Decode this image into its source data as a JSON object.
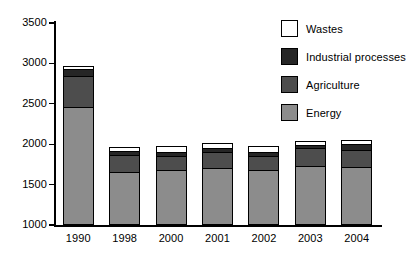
{
  "chart_data": {
    "type": "bar",
    "subtype": "stacked-bar",
    "title": "",
    "subtitle": "",
    "xlabel": "",
    "ylabel": "",
    "categories": [
      "1990",
      "1998",
      "2000",
      "2001",
      "2002",
      "2003",
      "2004"
    ],
    "ylim": [
      1000,
      3500
    ],
    "yticks": [
      1000,
      1500,
      2000,
      2500,
      3000,
      3500
    ],
    "ytick_labels": [
      "1000",
      "1500",
      "2000",
      "2500",
      "3000",
      "3500"
    ],
    "y_axis_starts_at_zero": false,
    "grid": false,
    "legend_position": "top-right",
    "stack_order_bottom_to_top": [
      "Energy",
      "Agriculture",
      "Industrial processes",
      "Wastes"
    ],
    "series": [
      {
        "name": "Energy",
        "color": "#8c8c8c",
        "values": [
          1465,
          650,
          680,
          705,
          675,
          725,
          720
        ]
      },
      {
        "name": "Agriculture",
        "color": "#4d4d4d",
        "values": [
          375,
          220,
          175,
          195,
          185,
          230,
          210
        ]
      },
      {
        "name": "Industrial processes",
        "color": "#262626",
        "values": [
          90,
          45,
          55,
          50,
          45,
          35,
          70
        ]
      },
      {
        "name": "Wastes",
        "color": "#ffffff",
        "values": [
          40,
          45,
          70,
          65,
          70,
          50,
          55
        ]
      }
    ],
    "cumulative_tops": {
      "Energy": [
        2465,
        1650,
        1680,
        1705,
        1675,
        1725,
        1720
      ],
      "Agriculture": [
        2840,
        1870,
        1855,
        1900,
        1860,
        1955,
        1930
      ],
      "Industrial processes": [
        2930,
        1915,
        1910,
        1950,
        1905,
        1990,
        2000
      ],
      "Wastes": [
        2970,
        1960,
        1980,
        2015,
        1975,
        2040,
        2055
      ]
    },
    "totals": [
      2970,
      1960,
      1980,
      2015,
      1975,
      2040,
      2055
    ]
  },
  "legend": {
    "items": [
      {
        "label": "Wastes",
        "color": "#ffffff"
      },
      {
        "label": "Industrial processes",
        "color": "#262626"
      },
      {
        "label": "Agriculture",
        "color": "#4d4d4d"
      },
      {
        "label": "Energy",
        "color": "#8c8c8c"
      }
    ]
  },
  "axes": {
    "y_tick_labels": [
      "3500",
      "3000",
      "2500",
      "2000",
      "1500",
      "1000"
    ],
    "x_tick_labels": [
      "1990",
      "1998",
      "2000",
      "2001",
      "2002",
      "2003",
      "2004"
    ]
  }
}
